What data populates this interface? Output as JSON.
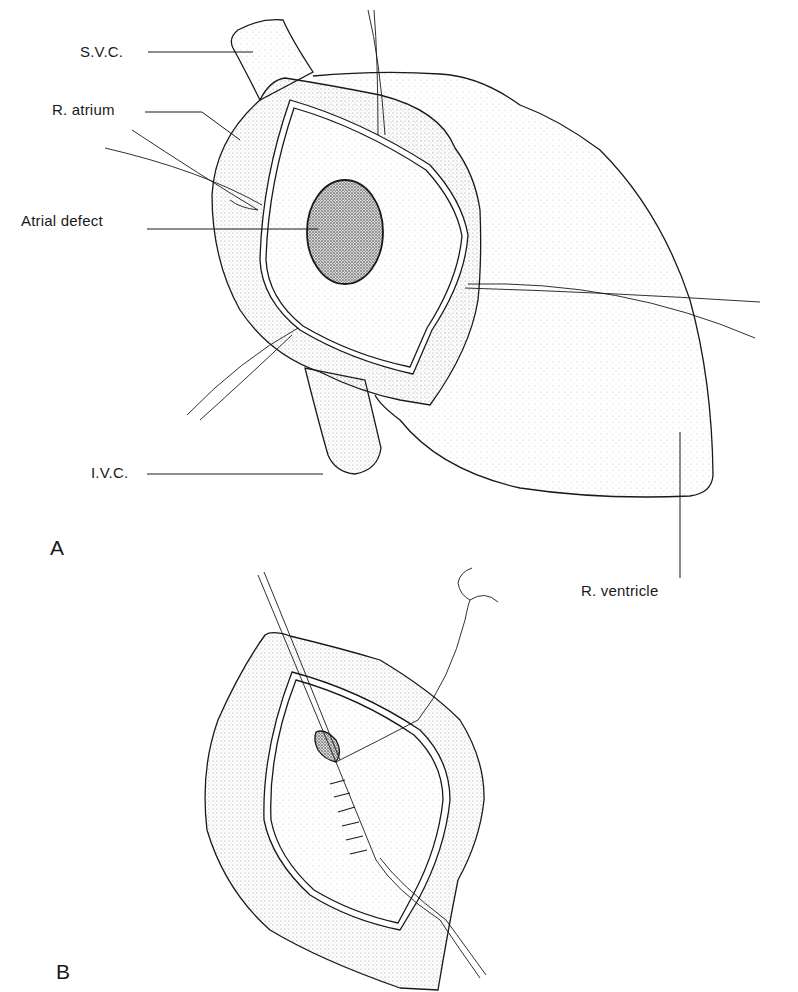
{
  "figure": {
    "panel_a": {
      "letter": "A",
      "labels": {
        "svc": "S.V.C.",
        "r_atrium": "R. atrium",
        "atrial_defect": "Atrial defect",
        "ivc": "I.V.C.",
        "r_ventricle": "R. ventricle"
      }
    },
    "panel_b": {
      "letter": "B"
    }
  },
  "colors": {
    "ink": "#1a1a1a",
    "stipple": "#9a9a9a",
    "defect": "#555555",
    "background": "#ffffff"
  }
}
